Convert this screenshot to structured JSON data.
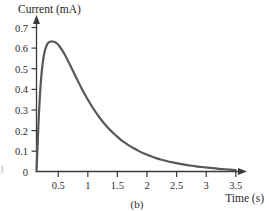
{
  "figure": {
    "caption": "(b)",
    "edge_fragment": ")"
  },
  "axes": {
    "y_title": "Current (mA)",
    "x_title": "Time (s)",
    "y_ticks": [
      "0.7",
      "0.6",
      "0.5",
      "0.4",
      "0.3",
      "0.2",
      "0.1",
      "0"
    ],
    "x_ticks": [
      "0.5",
      "1",
      "1.5",
      "2",
      "2.5",
      "3",
      "3.5"
    ]
  },
  "style": {
    "curve_color": "#585858",
    "axis_color": "#3a3a3a",
    "text_color": "#2a2a2a",
    "background": "#ffffff"
  },
  "chart_data": {
    "type": "line",
    "title": "",
    "xlabel": "Time (s)",
    "ylabel": "Current (mA)",
    "xlim": [
      0,
      3.8
    ],
    "ylim": [
      0,
      0.75
    ],
    "grid": false,
    "legend": null,
    "x_ticks": [
      0.5,
      1,
      1.5,
      2,
      2.5,
      3,
      3.5
    ],
    "y_ticks": [
      0,
      0.1,
      0.2,
      0.3,
      0.4,
      0.5,
      0.6,
      0.7
    ],
    "peak": {
      "x": 0.32,
      "y": 0.63
    },
    "series": [
      {
        "name": "Current",
        "x": [
          0.0,
          0.02,
          0.04,
          0.06,
          0.08,
          0.1,
          0.13,
          0.16,
          0.2,
          0.24,
          0.28,
          0.32,
          0.36,
          0.4,
          0.45,
          0.5,
          0.55,
          0.6,
          0.7,
          0.8,
          0.9,
          1.0,
          1.1,
          1.2,
          1.3,
          1.4,
          1.5,
          1.6,
          1.7,
          1.8,
          1.9,
          2.0,
          2.1,
          2.2,
          2.3,
          2.4,
          2.5,
          2.6,
          2.7,
          2.8,
          2.9,
          3.0,
          3.1,
          3.2,
          3.3,
          3.4,
          3.5
        ],
        "y": [
          0.0,
          0.13,
          0.265,
          0.37,
          0.448,
          0.505,
          0.565,
          0.6,
          0.624,
          0.631,
          0.632,
          0.63,
          0.622,
          0.61,
          0.59,
          0.566,
          0.54,
          0.512,
          0.455,
          0.4,
          0.35,
          0.305,
          0.265,
          0.23,
          0.2,
          0.174,
          0.15,
          0.131,
          0.114,
          0.099,
          0.086,
          0.075,
          0.065,
          0.057,
          0.05,
          0.044,
          0.038,
          0.033,
          0.029,
          0.025,
          0.022,
          0.019,
          0.016,
          0.013,
          0.011,
          0.009,
          0.007
        ]
      }
    ]
  }
}
